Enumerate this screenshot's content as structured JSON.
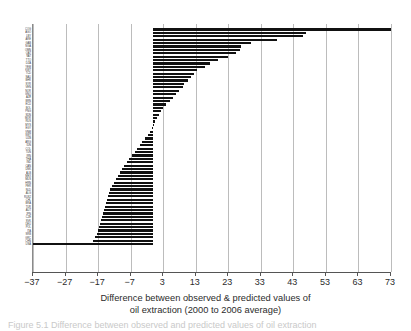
{
  "axis": {
    "x_caption_line1": "Difference between observed & predicted values of",
    "x_caption_line2": "oil extraction (2000 to 2006 average)",
    "ticks": [
      "-37",
      "-27",
      "-17",
      "-7",
      "3",
      "13",
      "23",
      "33",
      "43",
      "53",
      "63",
      "73"
    ]
  },
  "figure_caption": "Figure 5.1  Difference between observed and predicted values of oil extraction",
  "colors": {
    "bar": "#111111",
    "gridline": "#bcbcbc",
    "axis": "#555555",
    "text": "#2b2b2b"
  },
  "chart_data": {
    "type": "bar",
    "orientation": "horizontal",
    "title": "",
    "xlabel": "Difference between observed & predicted values of oil extraction (2000 to 2006 average)",
    "ylabel": "",
    "xlim": [
      -37,
      73
    ],
    "xticks": [
      -37,
      -27,
      -17,
      -7,
      3,
      13,
      23,
      33,
      43,
      53,
      63,
      73
    ],
    "grid": "vertical",
    "legend": "none",
    "categories": [
      "COG",
      "AGO",
      "LBY",
      "ARE",
      "GAB",
      "NGA",
      "OMN",
      "QAT",
      "VAT",
      "TTO",
      "DZA",
      "YEM",
      "KWT",
      "TCD",
      "SAU",
      "BHR",
      "SYR",
      "VEN",
      "NOR",
      "GNQ",
      "AZE",
      "BRN",
      "ECU",
      "BOL",
      "PNG",
      "SDN",
      "MOR",
      "RUS",
      "MYS",
      "EGY",
      "VNM",
      "SWT",
      "UZB",
      "ARG",
      "IDN",
      "COL",
      "TUN",
      "IRN",
      "THA",
      "IND",
      "CAN",
      "DNK",
      "ALB",
      "MEX",
      "MUS",
      "HRN",
      "PER",
      "NLD",
      "ALG",
      "RUS2",
      "CHL",
      "BRA",
      "TUR",
      "AUT",
      "JPN",
      "CZE",
      "SVK",
      "DEU",
      "POL",
      "ITA",
      "SRB",
      "GRC",
      "CHN",
      "USA"
    ],
    "values": [
      73.0,
      47.0,
      46.0,
      38.0,
      30.0,
      27.0,
      26.5,
      25.5,
      23.0,
      20.0,
      17.5,
      16.0,
      13.5,
      12.5,
      11.5,
      10.5,
      9.5,
      9.0,
      8.0,
      7.0,
      6.0,
      5.0,
      4.0,
      3.0,
      2.2,
      1.6,
      1.0,
      0.5,
      0.2,
      -0.4,
      -1.0,
      -1.8,
      -2.6,
      -3.4,
      -4.2,
      -5.0,
      -5.8,
      -6.6,
      -7.4,
      -8.2,
      -9.0,
      -9.8,
      -10.4,
      -11.0,
      -11.6,
      -12.2,
      -12.8,
      -13.2,
      -13.6,
      -14.0,
      -14.3,
      -14.6,
      -14.9,
      -15.2,
      -15.5,
      -15.8,
      -16.1,
      -16.4,
      -16.7,
      -17.0,
      -17.4,
      -17.8,
      -18.6,
      -37.0
    ]
  }
}
